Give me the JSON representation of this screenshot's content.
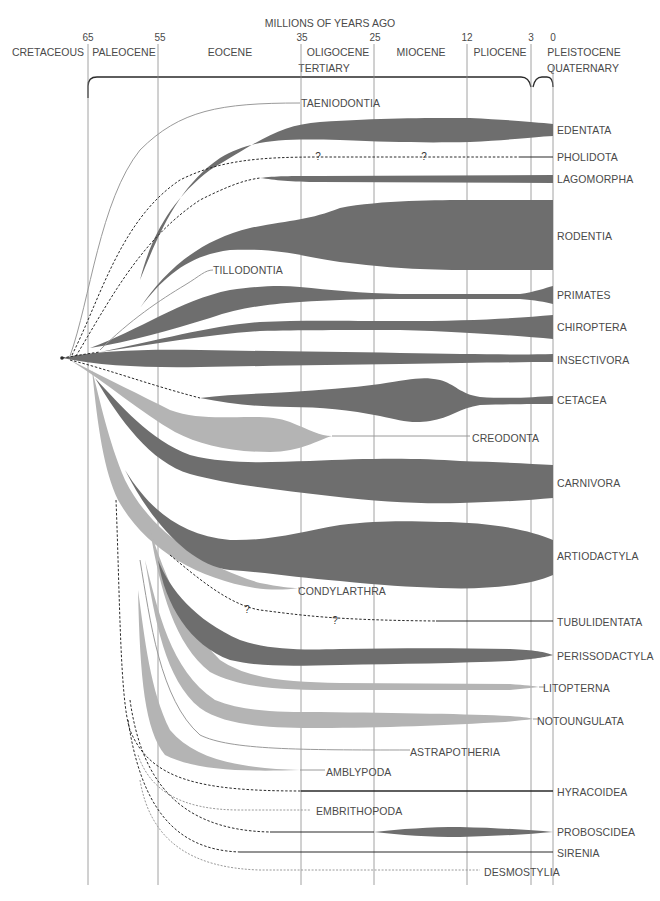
{
  "header": {
    "title": "MILLIONS OF YEARS AGO",
    "ticks": [
      {
        "value": "65",
        "x": 88
      },
      {
        "value": "55",
        "x": 158
      },
      {
        "value": "35",
        "x": 301
      },
      {
        "value": "25",
        "x": 374
      },
      {
        "value": "12",
        "x": 467
      },
      {
        "value": "3",
        "x": 531
      },
      {
        "value": "0",
        "x": 553
      }
    ],
    "epochs": [
      {
        "label": "CRETACEOUS",
        "x": 48
      },
      {
        "label": "PALEOCENE",
        "x": 124
      },
      {
        "label": "EOCENE",
        "x": 230
      },
      {
        "label": "OLIGOCENE",
        "x": 337
      },
      {
        "label": "MIOCENE",
        "x": 421
      },
      {
        "label": "PLIOCENE",
        "x": 500
      },
      {
        "label": "PLEISTOCENE",
        "x": 583
      }
    ],
    "periods": [
      {
        "label": "TERTIARY",
        "x": 323
      },
      {
        "label": "QUATERNARY",
        "x": 582
      }
    ]
  },
  "colors": {
    "dark_lineage": "#6e6e6e",
    "light_lineage": "#b4b4b4",
    "line": "#2a2a2a",
    "label": "#4a4a4a"
  },
  "lineages": [
    {
      "name": "TAENIODONTIA",
      "status": "extinct",
      "style": "light-line"
    },
    {
      "name": "EDENTATA",
      "status": "living",
      "style": "dark-spindle"
    },
    {
      "name": "PHOLIDOTA",
      "status": "living",
      "style": "dashed",
      "uncertain": true
    },
    {
      "name": "LAGOMORPHA",
      "status": "living",
      "style": "dark-spindle"
    },
    {
      "name": "RODENTIA",
      "status": "living",
      "style": "dark-spindle"
    },
    {
      "name": "TILLODONTIA",
      "status": "extinct",
      "style": "light-line"
    },
    {
      "name": "PRIMATES",
      "status": "living",
      "style": "dark-spindle"
    },
    {
      "name": "CHIROPTERA",
      "status": "living",
      "style": "dark-spindle"
    },
    {
      "name": "INSECTIVORA",
      "status": "living",
      "style": "dark-spindle"
    },
    {
      "name": "CETACEA",
      "status": "living",
      "style": "dark-spindle"
    },
    {
      "name": "CREODONTA",
      "status": "extinct",
      "style": "light-spindle"
    },
    {
      "name": "CARNIVORA",
      "status": "living",
      "style": "dark-spindle"
    },
    {
      "name": "ARTIODACTYLA",
      "status": "living",
      "style": "dark-spindle"
    },
    {
      "name": "CONDYLARTHRA",
      "status": "extinct",
      "style": "light-spindle"
    },
    {
      "name": "TUBULIDENTATA",
      "status": "living",
      "style": "dashed",
      "uncertain": true
    },
    {
      "name": "PERISSODACTYLA",
      "status": "living",
      "style": "dark-spindle"
    },
    {
      "name": "LITOPTERNA",
      "status": "extinct",
      "style": "light-spindle"
    },
    {
      "name": "NOTOUNGULATA",
      "status": "extinct",
      "style": "light-spindle"
    },
    {
      "name": "ASTRAPOTHERIA",
      "status": "extinct",
      "style": "light-line"
    },
    {
      "name": "AMBLYPODA",
      "status": "extinct",
      "style": "light-spindle"
    },
    {
      "name": "HYRACOIDEA",
      "status": "living",
      "style": "dark-line"
    },
    {
      "name": "EMBRITHOPODA",
      "status": "extinct",
      "style": "light-line"
    },
    {
      "name": "PROBOSCIDEA",
      "status": "living",
      "style": "dark-spindle"
    },
    {
      "name": "SIRENIA",
      "status": "living",
      "style": "dark-line"
    },
    {
      "name": "DESMOSTYLIA",
      "status": "extinct",
      "style": "light-line"
    }
  ],
  "question_mark": "?"
}
